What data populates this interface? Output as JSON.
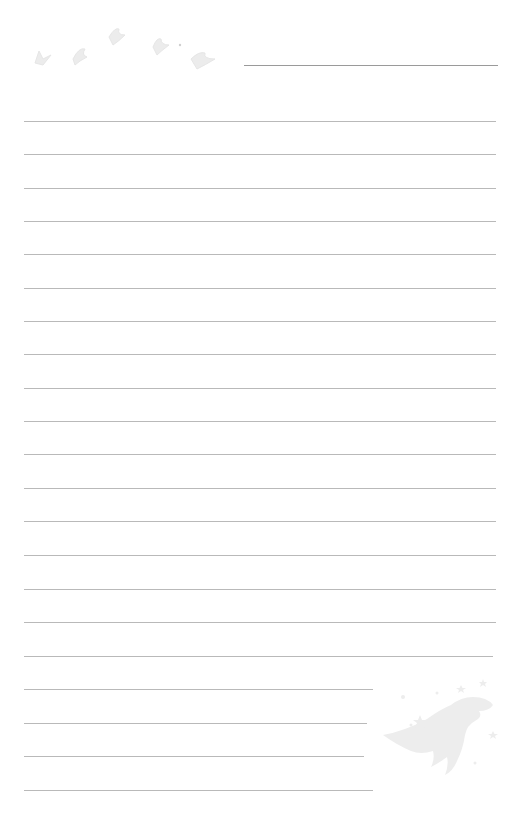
{
  "page": {
    "type": "lined-writing-paper",
    "background": "#ffffff",
    "line_color": "#b9b9b9"
  },
  "header": {
    "name_line": {
      "x1": 244,
      "x2": 498,
      "y": 65
    }
  },
  "decorations": {
    "top_left": "birds-icon",
    "bottom_right": "dinosaur-with-stars-icon"
  },
  "lines": [
    {
      "y": 121,
      "x1": 24,
      "x2": 496
    },
    {
      "y": 154,
      "x1": 24,
      "x2": 496
    },
    {
      "y": 188,
      "x1": 24,
      "x2": 496
    },
    {
      "y": 221,
      "x1": 24,
      "x2": 496
    },
    {
      "y": 254,
      "x1": 24,
      "x2": 496
    },
    {
      "y": 288,
      "x1": 24,
      "x2": 496
    },
    {
      "y": 321,
      "x1": 24,
      "x2": 496
    },
    {
      "y": 354,
      "x1": 24,
      "x2": 496
    },
    {
      "y": 388,
      "x1": 24,
      "x2": 496
    },
    {
      "y": 421,
      "x1": 24,
      "x2": 496
    },
    {
      "y": 454,
      "x1": 24,
      "x2": 496
    },
    {
      "y": 488,
      "x1": 24,
      "x2": 496
    },
    {
      "y": 521,
      "x1": 24,
      "x2": 496
    },
    {
      "y": 555,
      "x1": 24,
      "x2": 496
    },
    {
      "y": 589,
      "x1": 24,
      "x2": 496
    },
    {
      "y": 622,
      "x1": 24,
      "x2": 496
    },
    {
      "y": 656,
      "x1": 24,
      "x2": 493
    },
    {
      "y": 689,
      "x1": 24,
      "x2": 373
    },
    {
      "y": 723,
      "x1": 24,
      "x2": 367
    },
    {
      "y": 756,
      "x1": 24,
      "x2": 364
    },
    {
      "y": 790,
      "x1": 24,
      "x2": 373
    }
  ]
}
